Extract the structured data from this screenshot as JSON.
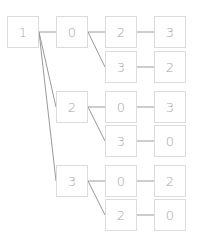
{
  "diagram": {
    "type": "tree",
    "box_size": 32,
    "colors": {
      "box_border": "#dcdcdc",
      "edge": "#9a9a9a",
      "text": "#a8a8a8"
    },
    "nodes": [
      {
        "id": "n1",
        "label": "1",
        "x": 7,
        "y": 16
      },
      {
        "id": "n2",
        "label": "0",
        "x": 56,
        "y": 16
      },
      {
        "id": "n3",
        "label": "2",
        "x": 105,
        "y": 16
      },
      {
        "id": "n4",
        "label": "3",
        "x": 154,
        "y": 16
      },
      {
        "id": "n5",
        "label": "3",
        "x": 105,
        "y": 51
      },
      {
        "id": "n6",
        "label": "2",
        "x": 154,
        "y": 51
      },
      {
        "id": "n7",
        "label": "2",
        "x": 56,
        "y": 91
      },
      {
        "id": "n8",
        "label": "0",
        "x": 105,
        "y": 91
      },
      {
        "id": "n9",
        "label": "3",
        "x": 154,
        "y": 91
      },
      {
        "id": "n10",
        "label": "3",
        "x": 105,
        "y": 125
      },
      {
        "id": "n11",
        "label": "0",
        "x": 154,
        "y": 125
      },
      {
        "id": "n12",
        "label": "3",
        "x": 56,
        "y": 165
      },
      {
        "id": "n13",
        "label": "0",
        "x": 105,
        "y": 165
      },
      {
        "id": "n14",
        "label": "2",
        "x": 154,
        "y": 165
      },
      {
        "id": "n15",
        "label": "2",
        "x": 105,
        "y": 199
      },
      {
        "id": "n16",
        "label": "0",
        "x": 154,
        "y": 199
      }
    ],
    "edges": [
      {
        "from": "n1",
        "to": "n2"
      },
      {
        "from": "n1",
        "to": "n7"
      },
      {
        "from": "n1",
        "to": "n12"
      },
      {
        "from": "n2",
        "to": "n3"
      },
      {
        "from": "n2",
        "to": "n5"
      },
      {
        "from": "n3",
        "to": "n4"
      },
      {
        "from": "n5",
        "to": "n6"
      },
      {
        "from": "n7",
        "to": "n8"
      },
      {
        "from": "n7",
        "to": "n10"
      },
      {
        "from": "n8",
        "to": "n9"
      },
      {
        "from": "n10",
        "to": "n11"
      },
      {
        "from": "n12",
        "to": "n13"
      },
      {
        "from": "n12",
        "to": "n15"
      },
      {
        "from": "n13",
        "to": "n14"
      },
      {
        "from": "n15",
        "to": "n16"
      }
    ]
  }
}
